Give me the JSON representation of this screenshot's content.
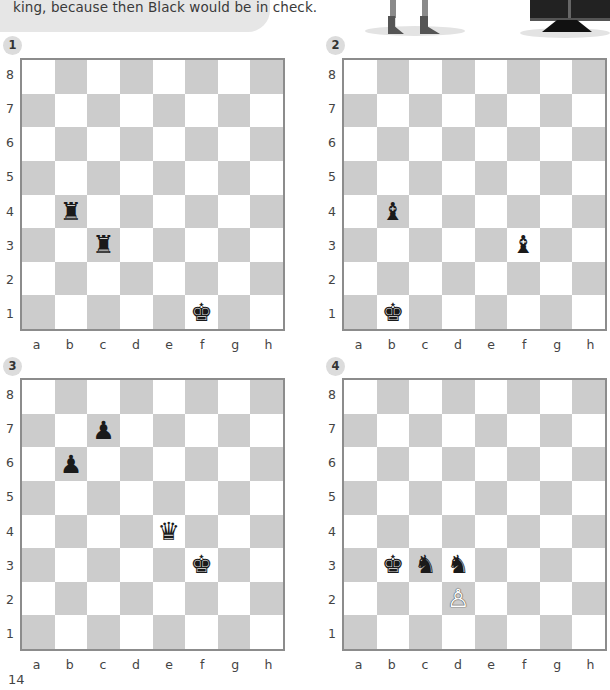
{
  "intro": {
    "text": "king, because then Black would be in check."
  },
  "page_number": "14",
  "files": [
    "a",
    "b",
    "c",
    "d",
    "e",
    "f",
    "g",
    "h"
  ],
  "ranks": [
    "8",
    "7",
    "6",
    "5",
    "4",
    "3",
    "2",
    "1"
  ],
  "colors": {
    "dark_square": "#cccccc",
    "light_square": "#ffffff",
    "border": "#8c8c8c",
    "badge": "#dcdcdc"
  },
  "puzzles": [
    {
      "number": "1",
      "pieces": [
        {
          "square": "b4",
          "type": "rook",
          "color": "black",
          "glyph": "♜"
        },
        {
          "square": "c3",
          "type": "rook",
          "color": "black",
          "glyph": "♜"
        },
        {
          "square": "f1",
          "type": "king",
          "color": "black",
          "glyph": "♚"
        }
      ]
    },
    {
      "number": "2",
      "pieces": [
        {
          "square": "b4",
          "type": "bishop",
          "color": "black",
          "glyph": "♝"
        },
        {
          "square": "f3",
          "type": "bishop",
          "color": "black",
          "glyph": "♝"
        },
        {
          "square": "b1",
          "type": "king",
          "color": "black",
          "glyph": "♚"
        }
      ]
    },
    {
      "number": "3",
      "pieces": [
        {
          "square": "c7",
          "type": "pawn",
          "color": "black",
          "glyph": "♟"
        },
        {
          "square": "b6",
          "type": "pawn",
          "color": "black",
          "glyph": "♟"
        },
        {
          "square": "e4",
          "type": "queen",
          "color": "black",
          "glyph": "♛"
        },
        {
          "square": "f3",
          "type": "king",
          "color": "black",
          "glyph": "♚"
        }
      ]
    },
    {
      "number": "4",
      "pieces": [
        {
          "square": "b3",
          "type": "king",
          "color": "black",
          "glyph": "♚"
        },
        {
          "square": "c3",
          "type": "knight",
          "color": "black",
          "glyph": "♞"
        },
        {
          "square": "d3",
          "type": "knight",
          "color": "black",
          "glyph": "♞"
        },
        {
          "square": "d2",
          "type": "pawn",
          "color": "white",
          "glyph": "♙"
        }
      ]
    }
  ]
}
